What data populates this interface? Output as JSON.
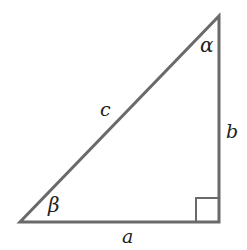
{
  "diagram": {
    "type": "right-triangle",
    "vertices": {
      "bottom_left": [
        20,
        222
      ],
      "bottom_right": [
        219,
        222
      ],
      "top": [
        219,
        16
      ]
    },
    "right_angle_box": {
      "x": 196,
      "y": 198,
      "size": 24
    },
    "stroke_color": "#6a6a6a",
    "labels": {
      "hypotenuse": "c",
      "vertical_side": "b",
      "horizontal_side": "a",
      "top_angle": "α",
      "bottom_left_angle": "β"
    }
  }
}
